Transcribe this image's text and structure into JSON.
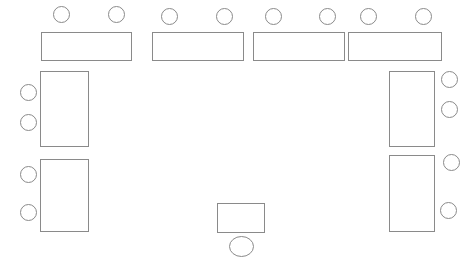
{
  "diagram": {
    "type": "floor-plan",
    "canvas": {
      "width": 476,
      "height": 270,
      "background": "#ffffff"
    },
    "style": {
      "stroke_color": "#8a8a8a",
      "fill_color": "#ffffff",
      "stroke_width": 1
    },
    "tables": [
      {
        "name": "table-top-1",
        "shape": "rectangle",
        "x": 41,
        "y": 32,
        "width": 90,
        "height": 28
      },
      {
        "name": "table-top-2",
        "shape": "rectangle",
        "x": 152,
        "y": 32,
        "width": 91,
        "height": 28
      },
      {
        "name": "table-top-3",
        "shape": "rectangle",
        "x": 253,
        "y": 32,
        "width": 91,
        "height": 28
      },
      {
        "name": "table-top-4",
        "shape": "rectangle",
        "x": 348,
        "y": 32,
        "width": 93,
        "height": 28
      },
      {
        "name": "table-left-upper",
        "shape": "rectangle",
        "x": 40,
        "y": 71,
        "width": 48,
        "height": 75
      },
      {
        "name": "table-left-lower",
        "shape": "rectangle",
        "x": 40,
        "y": 159,
        "width": 48,
        "height": 72
      },
      {
        "name": "table-right-upper",
        "shape": "rectangle",
        "x": 389,
        "y": 71,
        "width": 45,
        "height": 75
      },
      {
        "name": "table-right-lower",
        "shape": "rectangle",
        "x": 389,
        "y": 155,
        "width": 45,
        "height": 76
      },
      {
        "name": "table-bottom-center",
        "shape": "rectangle",
        "x": 217,
        "y": 203,
        "width": 47,
        "height": 29
      }
    ],
    "seats": [
      {
        "name": "seat-top-1",
        "shape": "circle",
        "cx": 61,
        "cy": 14,
        "rx": 8,
        "ry": 8
      },
      {
        "name": "seat-top-2",
        "shape": "circle",
        "cx": 116,
        "cy": 14,
        "rx": 8,
        "ry": 8
      },
      {
        "name": "seat-top-3",
        "shape": "circle",
        "cx": 169,
        "cy": 16,
        "rx": 8,
        "ry": 8
      },
      {
        "name": "seat-top-4",
        "shape": "circle",
        "cx": 224,
        "cy": 16,
        "rx": 8,
        "ry": 8
      },
      {
        "name": "seat-top-5",
        "shape": "circle",
        "cx": 273,
        "cy": 16,
        "rx": 8,
        "ry": 8
      },
      {
        "name": "seat-top-6",
        "shape": "circle",
        "cx": 327,
        "cy": 16,
        "rx": 8,
        "ry": 8
      },
      {
        "name": "seat-top-7",
        "shape": "circle",
        "cx": 368,
        "cy": 16,
        "rx": 8,
        "ry": 8
      },
      {
        "name": "seat-top-8",
        "shape": "circle",
        "cx": 423,
        "cy": 16,
        "rx": 8,
        "ry": 8
      },
      {
        "name": "seat-left-1",
        "shape": "circle",
        "cx": 28,
        "cy": 92,
        "rx": 8,
        "ry": 8
      },
      {
        "name": "seat-left-2",
        "shape": "circle",
        "cx": 28,
        "cy": 122,
        "rx": 8,
        "ry": 8
      },
      {
        "name": "seat-left-3",
        "shape": "circle",
        "cx": 28,
        "cy": 174,
        "rx": 8,
        "ry": 8
      },
      {
        "name": "seat-left-4",
        "shape": "circle",
        "cx": 28,
        "cy": 212,
        "rx": 8,
        "ry": 8
      },
      {
        "name": "seat-right-1",
        "shape": "circle",
        "cx": 449,
        "cy": 79,
        "rx": 8,
        "ry": 8
      },
      {
        "name": "seat-right-2",
        "shape": "circle",
        "cx": 449,
        "cy": 109,
        "rx": 8,
        "ry": 8
      },
      {
        "name": "seat-right-3",
        "shape": "circle",
        "cx": 451,
        "cy": 162,
        "rx": 8,
        "ry": 8
      },
      {
        "name": "seat-right-4",
        "shape": "circle",
        "cx": 448,
        "cy": 210,
        "rx": 8,
        "ry": 8
      },
      {
        "name": "seat-bottom-center",
        "shape": "ellipse",
        "cx": 241,
        "cy": 246,
        "rx": 12,
        "ry": 10
      }
    ]
  }
}
